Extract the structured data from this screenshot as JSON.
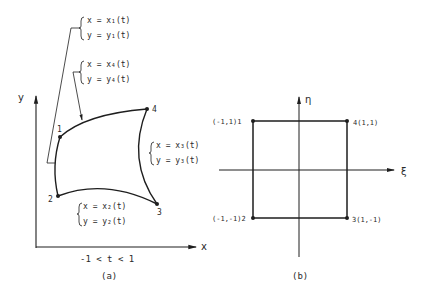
{
  "panel_a": {
    "caption": "(a)",
    "x_axis_label": "x",
    "y_axis_label": "y",
    "param_range": "-1 < t < 1",
    "nodes": [
      {
        "id": "1",
        "label": "1"
      },
      {
        "id": "2",
        "label": "2"
      },
      {
        "id": "3",
        "label": "3"
      },
      {
        "id": "4",
        "label": "4"
      }
    ],
    "edges": [
      {
        "id": "edge-1",
        "x_eq": "x = x₁(t)",
        "y_eq": "y = y₁(t)"
      },
      {
        "id": "edge-2",
        "x_eq": "x = x₂(t)",
        "y_eq": "y = y₂(t)"
      },
      {
        "id": "edge-3",
        "x_eq": "x = x₃(t)",
        "y_eq": "y = y₃(t)"
      },
      {
        "id": "edge-4",
        "x_eq": "x = x₄(t)",
        "y_eq": "y = y₄(t)"
      }
    ]
  },
  "panel_b": {
    "caption": "(b)",
    "xi_axis_label": "ξ",
    "eta_axis_label": "η",
    "corners": [
      {
        "id": "1",
        "label": "(-1,1)1"
      },
      {
        "id": "2",
        "label": "(-1,-1)2"
      },
      {
        "id": "3",
        "label": "3(1,-1)"
      },
      {
        "id": "4",
        "label": "4(1,1)"
      }
    ]
  }
}
